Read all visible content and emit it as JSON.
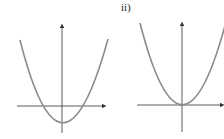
{
  "graphs": [
    {
      "label": "",
      "description": "Upward parabola with vertex below x-axis, two x-intercepts",
      "curve_color": "#8c8c8c",
      "axis_color": "#333333"
    },
    {
      "label": "ii)",
      "description": "Upward parabola with vertex at origin",
      "curve_color": "#8c8c8c",
      "axis_color": "#333333"
    }
  ]
}
